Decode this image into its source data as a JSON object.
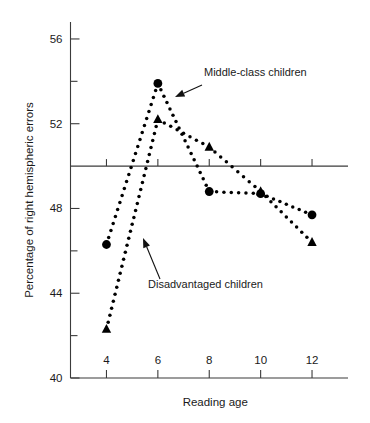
{
  "chart_data": {
    "type": "line",
    "title": "",
    "xlabel": "Reading age",
    "ylabel": "Percentage of right hemispheric errors",
    "x": [
      4,
      6,
      8,
      10,
      12
    ],
    "xlim": [
      2.6,
      13.4
    ],
    "ylim": [
      40,
      56.8
    ],
    "xticks": [
      4,
      6,
      8,
      10,
      12
    ],
    "xtick_labels": [
      "4",
      "6",
      "8",
      "10",
      "12"
    ],
    "yticks": [
      40,
      44,
      48,
      52,
      56
    ],
    "ytick_labels": [
      "40",
      "44",
      "48",
      "52",
      "56"
    ],
    "yminorticks": [
      42,
      46,
      50,
      54
    ],
    "grid": false,
    "legend_position": "annotations",
    "reference_line_y": 50,
    "linestyle": "dotted",
    "series": [
      {
        "name": "Middle-class children",
        "marker": "circle",
        "values": [
          46.3,
          53.9,
          48.8,
          48.7,
          47.7
        ]
      },
      {
        "name": "Disadvantaged children",
        "marker": "triangle",
        "values": [
          42.3,
          52.2,
          50.9,
          48.8,
          46.4
        ]
      }
    ],
    "annotations": [
      {
        "text": "Middle-class children",
        "text_x": 204,
        "text_y": 76,
        "arrow_from_x": 202,
        "arrow_from_y": 85,
        "arrow_to_x": 175,
        "arrow_to_y": 97
      },
      {
        "text": "Disadvantaged children",
        "text_x": 148,
        "text_y": 288,
        "arrow_from_x": 160,
        "arrow_from_y": 279,
        "arrow_to_x": 143,
        "arrow_to_y": 238
      }
    ]
  }
}
